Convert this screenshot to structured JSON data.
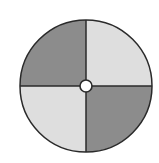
{
  "diagram": {
    "type": "quartered-disk",
    "center": {
      "x": 86,
      "y": 86
    },
    "radius": 66,
    "hole_radius": 6,
    "quadrants": [
      {
        "position": "top-left",
        "shade": "dark",
        "color": "#8c8c8c"
      },
      {
        "position": "top-right",
        "shade": "light",
        "color": "#dedede"
      },
      {
        "position": "bottom-right",
        "shade": "dark",
        "color": "#8c8c8c"
      },
      {
        "position": "bottom-left",
        "shade": "light",
        "color": "#dedede"
      }
    ],
    "outline_color": "#2a2a2a",
    "hole_color": "#ffffff"
  }
}
